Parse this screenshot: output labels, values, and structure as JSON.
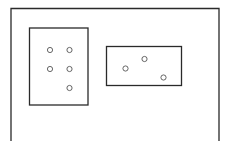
{
  "diagram": {
    "stroke_color": "#2a2a2a",
    "background_color": "#ffffff",
    "outer_frame": {
      "name": "outer-frame",
      "open_bottom": true
    },
    "boxes": [
      {
        "name": "left-box",
        "circle_count": 5
      },
      {
        "name": "right-box",
        "circle_count": 3
      }
    ]
  }
}
